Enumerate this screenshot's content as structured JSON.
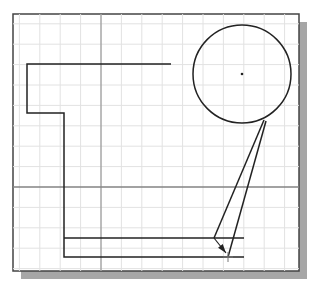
{
  "drawing": {
    "frame": {
      "x": 13,
      "y": 14,
      "w": 286,
      "h": 257,
      "border": "#444444"
    },
    "shadow": {
      "offset": 8,
      "color": "#a6a6a6"
    },
    "grid": {
      "spacing": 20.4,
      "origin_x": 101,
      "origin_y": 187,
      "color": "#e2e2e2"
    },
    "axes": {
      "x_axis_y": 187,
      "y_axis_x": 101,
      "color": "#555555"
    },
    "profile_polyline": [
      [
        171,
        64
      ],
      [
        27,
        64
      ],
      [
        27,
        113
      ],
      [
        64,
        113
      ],
      [
        64,
        257
      ],
      [
        244,
        257
      ]
    ],
    "inner_line": [
      [
        64,
        238
      ],
      [
        244,
        238
      ]
    ],
    "circle": {
      "cx": 242,
      "cy": 74,
      "r": 49
    },
    "tangent_lines": [
      [
        [
          264,
          120
        ],
        [
          214,
          238
        ]
      ],
      [
        [
          266,
          121
        ],
        [
          228,
          257
        ]
      ]
    ],
    "arrow": {
      "from": [
        214,
        238
      ],
      "to": [
        226,
        253
      ]
    },
    "cursor_point": [
      228,
      257
    ],
    "line_color": "#222222"
  }
}
